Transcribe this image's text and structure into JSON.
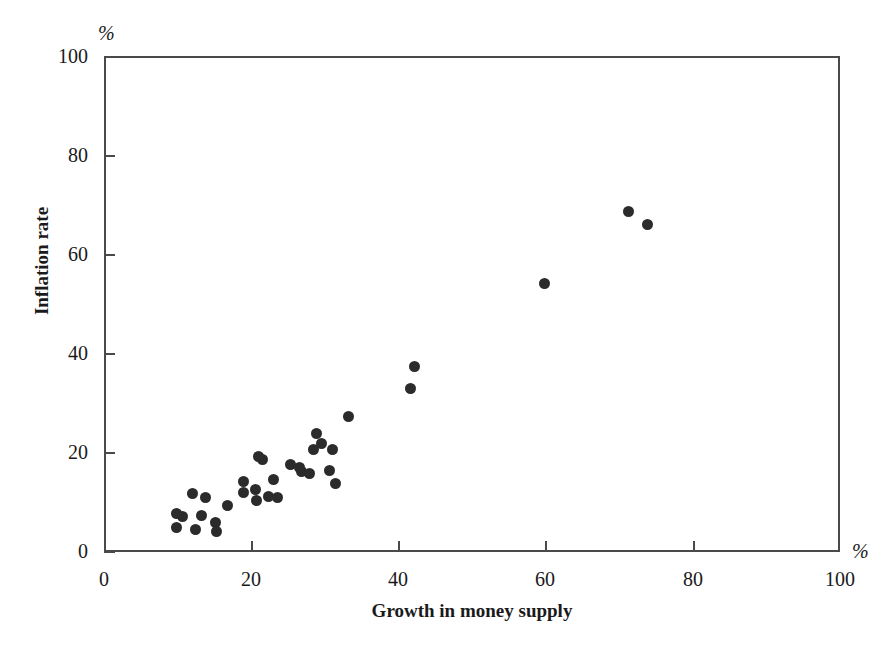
{
  "chart_data": {
    "type": "scatter",
    "title": "",
    "xlabel": "Growth in money supply",
    "ylabel": "Inflation rate",
    "x_unit": "%",
    "y_unit": "%",
    "xlim": [
      0,
      100
    ],
    "ylim": [
      0,
      100
    ],
    "xticks": [
      0,
      20,
      40,
      60,
      80,
      100
    ],
    "yticks": [
      0,
      20,
      40,
      60,
      80,
      100
    ],
    "xtick_labels": [
      "0",
      "20",
      "40",
      "60",
      "80",
      "100"
    ],
    "ytick_labels": [
      "0",
      "20",
      "40",
      "60",
      "80",
      "100"
    ],
    "grid": false,
    "legend": null,
    "marker": {
      "shape": "circle",
      "color": "#2b2b2b",
      "size": 11
    },
    "points": [
      {
        "x": 9.9,
        "y": 7.8
      },
      {
        "x": 9.8,
        "y": 5.0
      },
      {
        "x": 10.7,
        "y": 7.2
      },
      {
        "x": 12.0,
        "y": 11.7
      },
      {
        "x": 12.4,
        "y": 4.6
      },
      {
        "x": 13.3,
        "y": 7.4
      },
      {
        "x": 13.8,
        "y": 10.9
      },
      {
        "x": 15.1,
        "y": 6.0
      },
      {
        "x": 15.3,
        "y": 4.1
      },
      {
        "x": 16.8,
        "y": 9.4
      },
      {
        "x": 18.9,
        "y": 14.2
      },
      {
        "x": 19.0,
        "y": 11.9
      },
      {
        "x": 20.6,
        "y": 12.6
      },
      {
        "x": 20.7,
        "y": 10.3
      },
      {
        "x": 21.0,
        "y": 19.2
      },
      {
        "x": 21.6,
        "y": 18.7
      },
      {
        "x": 22.4,
        "y": 11.2
      },
      {
        "x": 23.0,
        "y": 14.7
      },
      {
        "x": 23.6,
        "y": 11.0
      },
      {
        "x": 25.4,
        "y": 17.6
      },
      {
        "x": 26.5,
        "y": 17.0
      },
      {
        "x": 26.8,
        "y": 16.3
      },
      {
        "x": 27.9,
        "y": 15.9
      },
      {
        "x": 28.4,
        "y": 20.7
      },
      {
        "x": 28.9,
        "y": 23.8
      },
      {
        "x": 29.6,
        "y": 21.9
      },
      {
        "x": 30.6,
        "y": 16.5
      },
      {
        "x": 31.1,
        "y": 20.6
      },
      {
        "x": 31.4,
        "y": 13.8
      },
      {
        "x": 33.2,
        "y": 27.3
      },
      {
        "x": 41.6,
        "y": 33.0
      },
      {
        "x": 42.2,
        "y": 37.5
      },
      {
        "x": 59.9,
        "y": 54.2
      },
      {
        "x": 71.3,
        "y": 68.7
      },
      {
        "x": 73.9,
        "y": 66.0
      }
    ]
  }
}
